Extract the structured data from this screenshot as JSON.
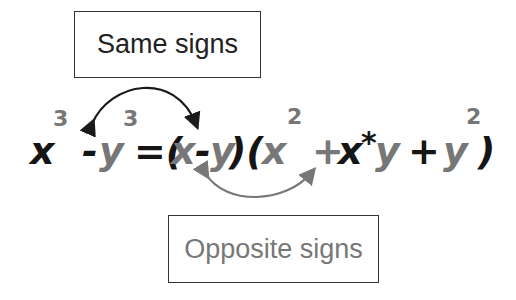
{
  "labels": {
    "same_signs": "Same signs",
    "opposite_signs": "Opposite signs"
  },
  "equation": {
    "tokens": [
      {
        "text": "x",
        "color": "dark"
      },
      {
        "text": "3",
        "color": "gray",
        "superscript": true
      },
      {
        "text": "-",
        "color": "dark"
      },
      {
        "text": "y",
        "color": "gray"
      },
      {
        "text": "3",
        "color": "gray",
        "superscript": true
      },
      {
        "text": "=(",
        "color": "dark"
      },
      {
        "text": "x",
        "color": "gray"
      },
      {
        "text": "-",
        "color": "dark"
      },
      {
        "text": "y",
        "color": "gray"
      },
      {
        "text": ")(",
        "color": "dark"
      },
      {
        "text": "x",
        "color": "gray"
      },
      {
        "text": "2",
        "color": "gray",
        "superscript": true
      },
      {
        "text": "+",
        "color": "gray"
      },
      {
        "text": "x",
        "color": "dark"
      },
      {
        "text": "*",
        "color": "dark"
      },
      {
        "text": "y",
        "color": "gray"
      },
      {
        "text": "+",
        "color": "dark"
      },
      {
        "text": "y",
        "color": "gray"
      },
      {
        "text": "2",
        "color": "gray",
        "superscript": true
      },
      {
        "text": ")",
        "color": "dark"
      }
    ],
    "full_text": "x^3 - y^3 = (x - y)(x^2 + x*y + y^2)"
  },
  "arrows": {
    "same_signs_arrow": {
      "color": "#1a1a1a",
      "connects": [
        "- (in x^3 - y^3)",
        "- (in x - y)"
      ]
    },
    "opposite_signs_arrow": {
      "color": "#777777",
      "connects": [
        "- (in x - y)",
        "+ (in x^2 + x*y)"
      ]
    }
  },
  "colors": {
    "dark": "#151515",
    "gray": "#777777"
  }
}
